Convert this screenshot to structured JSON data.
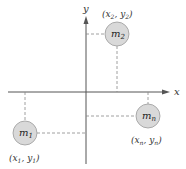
{
  "diagram": {
    "axes": {
      "x_label": "x",
      "y_label": "y",
      "origin": [
        86,
        92
      ]
    },
    "masses": [
      {
        "id": "m2",
        "label": "m",
        "sub": "2",
        "coord_x": "x",
        "coord_x_sub": "2",
        "coord_y": "y",
        "coord_y_sub": "2",
        "cx": 117,
        "cy": 34,
        "r": 12
      },
      {
        "id": "m1",
        "label": "m",
        "sub": "1",
        "coord_x": "x",
        "coord_x_sub": "1",
        "coord_y": "y",
        "coord_y_sub": "1",
        "cx": 25,
        "cy": 133,
        "r": 12
      },
      {
        "id": "mn",
        "label": "m",
        "sub": "n",
        "coord_x": "x",
        "coord_x_sub": "n",
        "coord_y": "y",
        "coord_y_sub": "n",
        "cx": 148,
        "cy": 116,
        "r": 12
      }
    ],
    "colors": {
      "axis": "#555555",
      "dash": "#888888",
      "circle_fill": "#d9d9d9",
      "circle_stroke": "#9a9a9a"
    }
  }
}
